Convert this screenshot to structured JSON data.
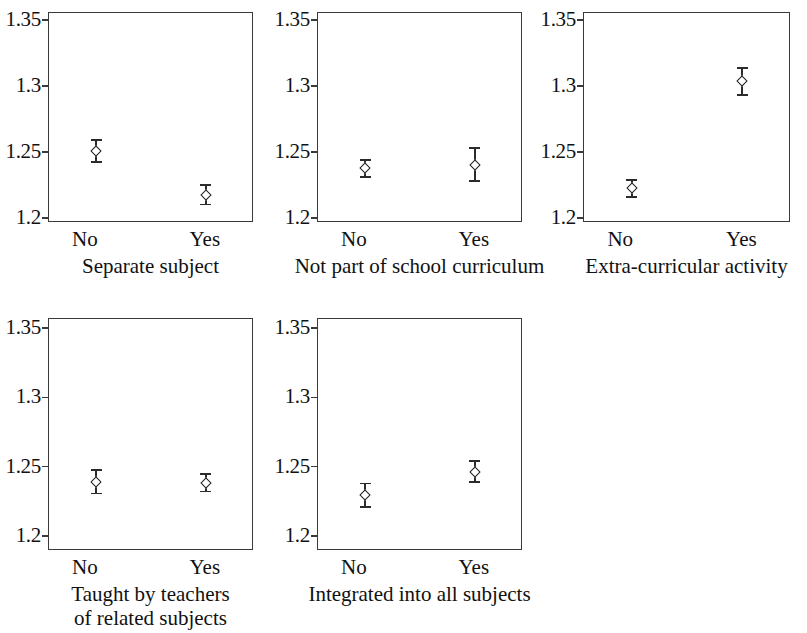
{
  "figure": {
    "width": 807,
    "height": 633,
    "background": "#ffffff",
    "axis_color": "#3a3a3a",
    "marker_color": "#1d1d1d"
  },
  "axis": {
    "y_ticks": [
      "1.35",
      "1.3",
      "1.25",
      "1.2"
    ],
    "y_values": [
      1.35,
      1.3,
      1.25,
      1.2
    ],
    "x_categories": [
      "No",
      "Yes"
    ]
  },
  "panels": [
    {
      "id": "separate-subject",
      "caption_line1": "Separate subject",
      "caption_line2": "",
      "points": [
        {
          "category": "No",
          "value": 1.2505,
          "low": 1.2415,
          "high": 1.2595
        },
        {
          "category": "Yes",
          "value": 1.2175,
          "low": 1.2095,
          "high": 1.2255
        }
      ]
    },
    {
      "id": "not-part-of-school-curriculum",
      "caption_line1": "Not part of school curriculum",
      "caption_line2": "",
      "points": [
        {
          "category": "No",
          "value": 1.2375,
          "low": 1.2305,
          "high": 1.2445
        },
        {
          "category": "Yes",
          "value": 1.2405,
          "low": 1.2275,
          "high": 1.2535
        }
      ]
    },
    {
      "id": "extra-curricular-activity",
      "caption_line1": "Extra-curricular activity",
      "caption_line2": "",
      "points": [
        {
          "category": "No",
          "value": 1.2225,
          "low": 1.2155,
          "high": 1.2295
        },
        {
          "category": "Yes",
          "value": 1.3035,
          "low": 1.2925,
          "high": 1.3145
        }
      ]
    },
    {
      "id": "taught-by-teachers-of-related-subjects",
      "caption_line1": "Taught by teachers",
      "caption_line2": "of related subjects",
      "points": [
        {
          "category": "No",
          "value": 1.239,
          "low": 1.23,
          "high": 1.248
        },
        {
          "category": "Yes",
          "value": 1.2385,
          "low": 1.2315,
          "high": 1.2455
        }
      ]
    },
    {
      "id": "integrated-into-all-subjects",
      "caption_line1": "Integrated into all subjects",
      "caption_line2": "",
      "points": [
        {
          "category": "No",
          "value": 1.2295,
          "low": 1.2205,
          "high": 1.2385
        },
        {
          "category": "Yes",
          "value": 1.2465,
          "low": 1.2385,
          "high": 1.2545
        }
      ]
    }
  ],
  "chart_data": {
    "type": "scatter",
    "title": "",
    "subtitle": "",
    "xlabel": "",
    "ylabel": "",
    "ylim": [
      1.2,
      1.35
    ],
    "y_ticks": [
      1.2,
      1.25,
      1.3,
      1.35
    ],
    "grid": false,
    "legend": "none",
    "categories": [
      "No",
      "Yes"
    ],
    "error_bars": "symmetric vertical with caps",
    "panel_layout": "2 rows x 3 columns (5 panels, last cell empty)",
    "panels": [
      {
        "name": "Separate subject",
        "categories": [
          "No",
          "Yes"
        ],
        "values": [
          1.2505,
          1.2175
        ],
        "err_low": [
          1.2415,
          1.2095
        ],
        "err_high": [
          1.2595,
          1.2255
        ]
      },
      {
        "name": "Not part of school curriculum",
        "categories": [
          "No",
          "Yes"
        ],
        "values": [
          1.2375,
          1.2405
        ],
        "err_low": [
          1.2305,
          1.2275
        ],
        "err_high": [
          1.2445,
          1.2535
        ]
      },
      {
        "name": "Extra-curricular activity",
        "categories": [
          "No",
          "Yes"
        ],
        "values": [
          1.2225,
          1.3035
        ],
        "err_low": [
          1.2155,
          1.2925
        ],
        "err_high": [
          1.2295,
          1.3145
        ]
      },
      {
        "name": "Taught by teachers of related subjects",
        "categories": [
          "No",
          "Yes"
        ],
        "values": [
          1.239,
          1.2385
        ],
        "err_low": [
          1.23,
          1.2315
        ],
        "err_high": [
          1.248,
          1.2455
        ]
      },
      {
        "name": "Integrated into all subjects",
        "categories": [
          "No",
          "Yes"
        ],
        "values": [
          1.2295,
          1.2465
        ],
        "err_low": [
          1.2205,
          1.2385
        ],
        "err_high": [
          1.2385,
          1.2545
        ]
      }
    ]
  }
}
